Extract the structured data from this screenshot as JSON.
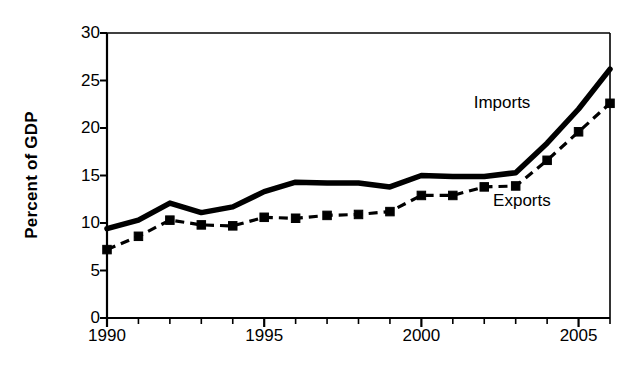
{
  "chart_data": {
    "type": "line",
    "title": "",
    "xlabel": "",
    "ylabel": "Percent of GDP",
    "xlim": [
      1990,
      2006
    ],
    "ylim": [
      0,
      30
    ],
    "yticks": [
      0,
      5,
      10,
      15,
      20,
      25,
      30
    ],
    "xticks": [
      1990,
      1991,
      1992,
      1993,
      1994,
      1995,
      1996,
      1997,
      1998,
      1999,
      2000,
      2001,
      2002,
      2003,
      2004,
      2005,
      2006
    ],
    "xtick_labels_shown": [
      "1990",
      "1995",
      "2000",
      "2005"
    ],
    "grid": false,
    "legend_position": "inline-annotations",
    "x": [
      1990,
      1991,
      1992,
      1993,
      1994,
      1995,
      1996,
      1997,
      1998,
      1999,
      2000,
      2001,
      2002,
      2003,
      2004,
      2005,
      2006
    ],
    "series": [
      {
        "name": "Imports",
        "style": "solid-thick",
        "color": "#000000",
        "markers": false,
        "values": [
          9.4,
          10.3,
          12.1,
          11.1,
          11.7,
          13.3,
          14.3,
          14.2,
          14.2,
          13.8,
          15.0,
          14.9,
          14.9,
          15.3,
          18.4,
          22.0,
          26.2
        ]
      },
      {
        "name": "Exports",
        "style": "dashed",
        "color": "#000000",
        "markers": true,
        "marker": "square",
        "values": [
          7.2,
          8.6,
          10.3,
          9.8,
          9.7,
          10.6,
          10.5,
          10.8,
          10.9,
          11.2,
          12.9,
          12.9,
          13.8,
          13.9,
          16.6,
          19.6,
          22.6
        ]
      }
    ],
    "annotations": [
      {
        "text": "Imports",
        "x": 2003.0,
        "y": 22.5
      },
      {
        "text": "Exports",
        "x": 2003.3,
        "y": 12.2
      }
    ],
    "axis": {
      "ylabel_text": "Percent of GDP",
      "tick_labels_y": [
        "0",
        "5",
        "10",
        "15",
        "20",
        "25",
        "30"
      ],
      "tick_labels_x": [
        "1990",
        "1995",
        "2000",
        "2005"
      ]
    }
  }
}
